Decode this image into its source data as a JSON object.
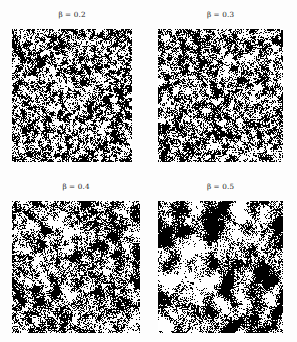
{
  "figure": {
    "background_color": "#fdfdfd",
    "rows": 2,
    "columns": 2,
    "width": 297,
    "height": 342
  },
  "chart_data": {
    "type": "heatmap",
    "title": "",
    "subtitle": "",
    "xlabel": "",
    "ylabel": "",
    "grid": false,
    "legend": false,
    "layout": {
      "rows": 2,
      "cols": 2,
      "order": "row-major"
    },
    "colormap": "binary",
    "colors": {
      "spin_up": "#000000",
      "spin_down": "#ffffff"
    },
    "panels": [
      {
        "index": 0,
        "title": "β = 0.2",
        "symbol": "β",
        "separator": "=",
        "beta": 0.2,
        "lattice_size": 128,
        "correlation_length": 1.0,
        "black_fraction": 0.5,
        "seed": 20
      },
      {
        "index": 1,
        "title": "β = 0.3",
        "symbol": "β",
        "separator": "=",
        "beta": 0.3,
        "lattice_size": 128,
        "correlation_length": 1.45,
        "black_fraction": 0.5,
        "seed": 30
      },
      {
        "index": 2,
        "title": "β = 0.4",
        "symbol": "β",
        "separator": "=",
        "beta": 0.4,
        "lattice_size": 128,
        "correlation_length": 2.3,
        "black_fraction": 0.5,
        "seed": 40
      },
      {
        "index": 3,
        "title": "β = 0.5",
        "symbol": "β",
        "separator": "=",
        "beta": 0.5,
        "lattice_size": 128,
        "correlation_length": 4.1,
        "black_fraction": 0.5,
        "seed": 50
      }
    ]
  }
}
